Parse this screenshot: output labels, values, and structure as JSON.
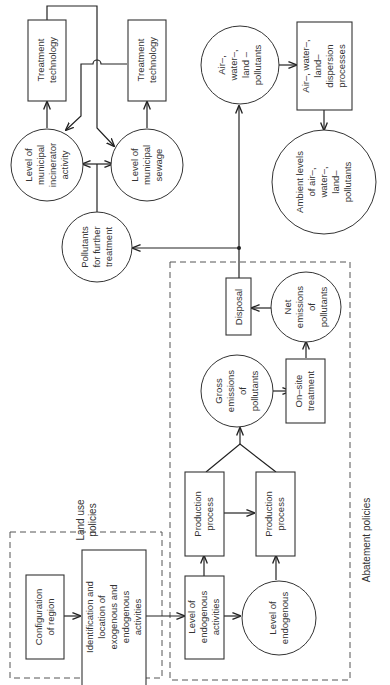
{
  "diagram": {
    "orientation": "rotated 90° counter-clockwise (text reads bottom-to-top)",
    "regions": {
      "land_use": {
        "label_1": "Land use",
        "label_2": "policies"
      },
      "abatement": {
        "label": "Abatement policies"
      }
    },
    "nodes": {
      "configuration": {
        "shape": "box",
        "lines": [
          "Configuration",
          "of region"
        ]
      },
      "identification": {
        "shape": "box",
        "lines": [
          "Identification and",
          "location of",
          "exogenous and",
          "endogenous",
          "activities"
        ]
      },
      "level_endogenous_activities": {
        "shape": "box",
        "lines": [
          "Level of",
          "endogenous",
          "activities"
        ]
      },
      "level_endogenous": {
        "shape": "circle",
        "lines": [
          "Level of",
          "endogenous"
        ]
      },
      "production_process_1": {
        "shape": "box",
        "lines": [
          "Production",
          "process"
        ]
      },
      "production_process_2": {
        "shape": "box",
        "lines": [
          "Production",
          "process"
        ]
      },
      "gross_emissions": {
        "shape": "circle",
        "lines": [
          "Gross",
          "emissions",
          "of",
          "pollutants"
        ]
      },
      "onsite_treatment": {
        "shape": "box",
        "lines": [
          "On–site",
          "treatment"
        ]
      },
      "net_emissions": {
        "shape": "circle",
        "lines": [
          "Net",
          "emissions",
          "of",
          "pollutants"
        ]
      },
      "disposal": {
        "shape": "box",
        "lines": [
          "Disposal"
        ]
      },
      "pollutants_further": {
        "shape": "circle",
        "lines": [
          "Pollutants",
          "for further",
          "treatment"
        ]
      },
      "incinerator": {
        "shape": "circle",
        "lines": [
          "Level of",
          "municipal",
          "incinerator",
          "activity"
        ]
      },
      "sewage": {
        "shape": "circle",
        "lines": [
          "Level of",
          "municipal",
          "sewage"
        ]
      },
      "treatment_tech_1": {
        "shape": "box",
        "lines": [
          "Treatment",
          "technology"
        ]
      },
      "treatment_tech_2": {
        "shape": "box",
        "lines": [
          "Treatment",
          "technology"
        ]
      },
      "air_water_land_pollutants": {
        "shape": "circle",
        "lines": [
          "Air–,",
          "water–,",
          "land –",
          "pollutants"
        ]
      },
      "dispersion": {
        "shape": "box",
        "lines": [
          "Air–, water–,",
          "land–",
          "dispersion",
          "processes"
        ]
      },
      "ambient_levels": {
        "shape": "circle",
        "lines": [
          "Ambient levels",
          "of air–,",
          "water–,",
          "land–",
          "pollutants"
        ]
      }
    },
    "edges": [
      [
        "configuration",
        "identification"
      ],
      [
        "identification",
        "level_endogenous_activities"
      ],
      [
        "level_endogenous_activities",
        "level_endogenous"
      ],
      [
        "level_endogenous_activities",
        "production_process_1"
      ],
      [
        "level_endogenous",
        "production_process_2"
      ],
      [
        "production_process_1",
        "production_process_2"
      ],
      [
        "production_process_1",
        "gross_emissions"
      ],
      [
        "production_process_2",
        "gross_emissions"
      ],
      [
        "gross_emissions",
        "onsite_treatment"
      ],
      [
        "onsite_treatment",
        "net_emissions"
      ],
      [
        "net_emissions",
        "disposal"
      ],
      [
        "disposal",
        "pollutants_further"
      ],
      [
        "disposal",
        "air_water_land_pollutants"
      ],
      [
        "pollutants_further",
        "incinerator"
      ],
      [
        "pollutants_further",
        "sewage"
      ],
      [
        "incinerator",
        "treatment_tech_1"
      ],
      [
        "sewage",
        "treatment_tech_2"
      ],
      [
        "treatment_tech_1",
        "sewage"
      ],
      [
        "treatment_tech_2",
        "incinerator"
      ],
      [
        "air_water_land_pollutants",
        "dispersion"
      ],
      [
        "dispersion",
        "ambient_levels"
      ]
    ]
  }
}
